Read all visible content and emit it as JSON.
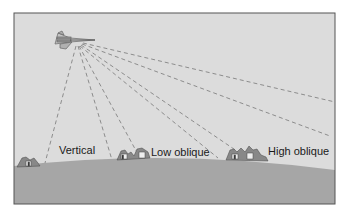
{
  "diagram": {
    "type": "aerial-photography-angles",
    "labels": {
      "vertical": "Vertical",
      "low_oblique": "Low oblique",
      "high_oblique": "High oblique"
    },
    "colors": {
      "sky": "#dcdcdc",
      "ground": "#a6a6a6",
      "frame": "#555555",
      "lines": "#777777",
      "text": "#1a1a1a"
    }
  }
}
